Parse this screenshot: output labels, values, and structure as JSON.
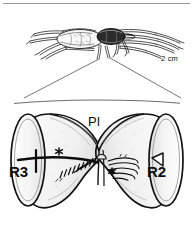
{
  "figure": {
    "panels": {
      "upper": {
        "name": "habitus-panel",
        "subject": "spider-lateral-view",
        "scale_bar": {
          "label": "2 cm",
          "length_px": 30
        }
      },
      "lower": {
        "name": "stridulatory-detail-panel",
        "subject": "coxa-trochanter-stridulatory-organ",
        "labels": {
          "left_segment": "R3",
          "right_segment": "R2",
          "top_region": "Pl"
        },
        "markers": {
          "asterisk_left": "*",
          "asterisk_right": "*"
        }
      }
    },
    "colors": {
      "ink": "#0d0d0d",
      "line": "#1a1a1a",
      "paper": "#ffffff",
      "shade_light": "#efefef",
      "shade_mid": "#d8d8d8",
      "guide": "#5a5a5a"
    }
  }
}
